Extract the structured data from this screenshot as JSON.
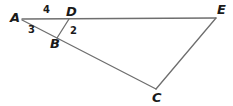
{
  "figure": {
    "kind": "geometry-diagram",
    "background_color": "#ffffff",
    "line_color": "#6e6e6e",
    "label_color": "#1a1a1a",
    "canvas": {
      "width": 233,
      "height": 106
    },
    "vertices": [
      {
        "id": "A",
        "label": "A",
        "point": {
          "x": 22,
          "y": 19
        },
        "label_pos": {
          "x": 10,
          "y": 12
        }
      },
      {
        "id": "D",
        "label": "D",
        "point": {
          "x": 69,
          "y": 19
        },
        "label_pos": {
          "x": 66,
          "y": 6
        }
      },
      {
        "id": "E",
        "label": "E",
        "point": {
          "x": 216,
          "y": 18
        },
        "label_pos": {
          "x": 217,
          "y": 4
        }
      },
      {
        "id": "B",
        "label": "B",
        "point": {
          "x": 58,
          "y": 36
        },
        "label_pos": {
          "x": 50,
          "y": 38
        }
      },
      {
        "id": "C",
        "label": "C",
        "point": {
          "x": 156,
          "y": 89
        },
        "label_pos": {
          "x": 152,
          "y": 92
        }
      }
    ],
    "segments": [
      {
        "id": "AE",
        "from": "A",
        "to": "E",
        "x1": 22,
        "y1": 19,
        "x2": 216,
        "y2": 18
      },
      {
        "id": "AC",
        "from": "A",
        "to": "C",
        "x1": 22,
        "y1": 20,
        "x2": 156,
        "y2": 89
      },
      {
        "id": "DB",
        "from": "D",
        "to": "B",
        "x1": 69,
        "y1": 19,
        "x2": 57,
        "y2": 38
      },
      {
        "id": "EC",
        "from": "E",
        "to": "C",
        "x1": 216,
        "y1": 18,
        "x2": 156,
        "y2": 89
      }
    ],
    "angle_labels": [
      {
        "id": "angle-4",
        "text": "4",
        "x": 43,
        "y": 5
      },
      {
        "id": "angle-3",
        "text": "3",
        "x": 28,
        "y": 25
      },
      {
        "id": "angle-2",
        "text": "2",
        "x": 70,
        "y": 26
      }
    ]
  }
}
